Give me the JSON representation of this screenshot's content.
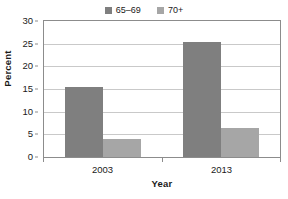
{
  "chart_data": {
    "type": "bar",
    "title": "",
    "categories": [
      "2003",
      "2013"
    ],
    "series": [
      {
        "name": "65–69",
        "values": [
          15.4,
          25.3
        ],
        "color": "#7f7f7f"
      },
      {
        "name": "70+",
        "values": [
          3.9,
          6.4
        ],
        "color": "#a6a6a6"
      }
    ],
    "xlabel": "Year",
    "ylabel": "Percent",
    "ylim": [
      0,
      30
    ],
    "yticks": [
      0,
      5,
      10,
      15,
      20,
      25,
      30
    ],
    "ytick_labels": [
      "0",
      "5",
      "10",
      "15",
      "20",
      "25",
      "30"
    ],
    "grid": "horizontal",
    "legend_position": "top-center"
  },
  "legend": {
    "entries": [
      {
        "label": "65–69",
        "swatch_name": "legend-swatch-65-69"
      },
      {
        "label": "70+",
        "swatch_name": "legend-swatch-70-plus"
      }
    ]
  },
  "axes": {
    "y_title": "Percent",
    "x_title": "Year",
    "y_tick_labels": [
      "30",
      "25",
      "20",
      "15",
      "10",
      "5",
      "0"
    ],
    "x_tick_labels": [
      "2003",
      "2013"
    ]
  },
  "colors": {
    "series_65_69": "#7f7f7f",
    "series_70_plus": "#a6a6a6",
    "gridline": "#c9c9c9",
    "axis": "#8c8c8c",
    "text": "#1a1a1a",
    "background": "#ffffff"
  }
}
